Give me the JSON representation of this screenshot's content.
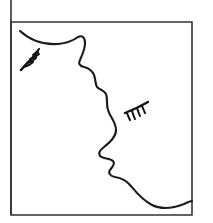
{
  "image": {
    "title": "Line drawing of a woman's face in profile",
    "kind": "line-art-illustration",
    "background_color": "#ffffff",
    "ink_color": "#1a1a1a",
    "frame_color": "#333333",
    "width": 213,
    "height": 223
  },
  "frame": {
    "name": "rectangular-border",
    "left_x": 11,
    "top_y": 22,
    "right_x": 192,
    "bottom_y": 215,
    "left_rule_extends_above_top": true,
    "left_rule_top_y": 0
  },
  "parts": [
    {
      "name": "forehead-and-hairline",
      "label": "Forehead / hairline curve"
    },
    {
      "name": "brow-ridge",
      "label": "Brow ridge"
    },
    {
      "name": "nose-bridge",
      "label": "Nose bridge"
    },
    {
      "name": "nose-tip",
      "label": "Nose tip"
    },
    {
      "name": "upper-lip",
      "label": "Upper lip"
    },
    {
      "name": "lower-lip",
      "label": "Lower lip"
    },
    {
      "name": "chin",
      "label": "Chin"
    },
    {
      "name": "jaw-and-neck",
      "label": "Jaw and neck line"
    },
    {
      "name": "left-eye-lashes",
      "label": "Far eye with lashes"
    },
    {
      "name": "right-eye-lashes",
      "label": "Near eye with lashes"
    }
  ],
  "profile_path": "M 20 31 C 30 40, 44 45, 58 44 C 68 43, 74 40, 78 37 C 82 35, 85 37, 85 43 C 85 50, 82 55, 80 60 C 78 64, 80 66, 84 67 C 88 68, 92 70, 94 75 C 96 80, 95 84, 97 87 C 100 90, 104 90, 106 94 C 108 99, 106 104, 108 110 C 110 117, 116 122, 116 130 C 116 137, 110 142, 104 147 C 100 150, 98 153, 100 156 C 103 159, 110 158, 113 161 C 116 164, 112 167, 110 170 C 108 173, 110 176, 115 177 C 121 178, 126 180, 130 185 C 136 192, 142 200, 152 205 C 162 210, 174 208, 184 204 C 188 202, 190 201, 192 201",
  "left_eye": {
    "lid_path": "M 21 70 C 26 64, 32 58, 38 52",
    "lash_paths": [
      "M 24 67 C 28 66, 31 64, 33 62",
      "M 27 63 C 31 62, 34 60, 36 58",
      "M 30 59 C 34 58, 37 56, 39 54",
      "M 33 55 C 36 53, 38 51, 39 49"
    ]
  },
  "right_eye": {
    "lid_path": "M 125 113 C 133 110, 141 106, 148 102",
    "lash_paths": [
      "M 127 113 C 128 116, 129 118, 130 120",
      "M 132 111 C 133 114, 134 117, 135 119",
      "M 137 108 C 138 111, 139 114, 140 116",
      "M 142 106 C 143 108, 144 111, 145 113"
    ]
  }
}
